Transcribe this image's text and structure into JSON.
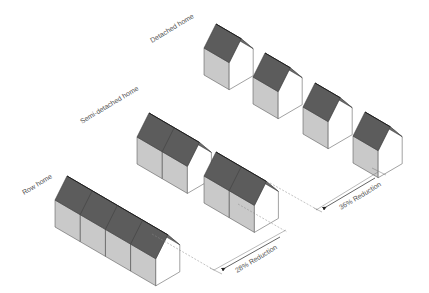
{
  "labels": {
    "detached": "Detached home",
    "semi": "Semi-detached home",
    "row": "Row home",
    "reduction_semi": "36% Reduction",
    "reduction_row": "28% Reduction"
  },
  "colors": {
    "roof": "#5c5c5c",
    "side_wall": "#c9c9c9",
    "gable_wall": "#ffffff",
    "ridge": "#1e1e1e"
  },
  "houses": {
    "detached": [
      {
        "x": 204,
        "y": 75,
        "units": 1
      },
      {
        "x": 253,
        "y": 104,
        "units": 1
      },
      {
        "x": 303,
        "y": 134,
        "units": 1
      },
      {
        "x": 353,
        "y": 163,
        "units": 1
      }
    ],
    "semi_detached": [
      {
        "x": 137,
        "y": 164,
        "units": 2
      },
      {
        "x": 204,
        "y": 203,
        "units": 2
      }
    ],
    "row": [
      {
        "x": 55,
        "y": 227,
        "units": 4
      }
    ]
  }
}
